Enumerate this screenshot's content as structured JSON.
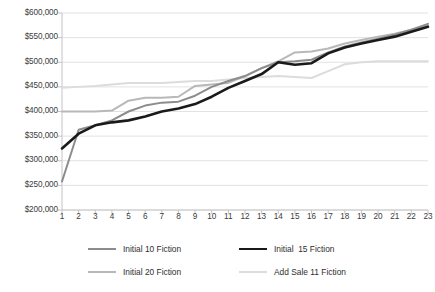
{
  "chart_data": {
    "type": "line",
    "title": "",
    "xlabel": "",
    "ylabel": "",
    "x": [
      1,
      2,
      3,
      4,
      5,
      6,
      7,
      8,
      9,
      10,
      11,
      12,
      13,
      14,
      15,
      16,
      17,
      18,
      19,
      20,
      21,
      22,
      23
    ],
    "xtick_labels": [
      "1",
      "2",
      "3",
      "4",
      "5",
      "6",
      "7",
      "8",
      "9",
      "10",
      "11",
      "12",
      "13",
      "14",
      "15",
      "16",
      "17",
      "18",
      "19",
      "20",
      "21",
      "22",
      "23"
    ],
    "ytick_labels": [
      "$600,000",
      "$550,000",
      "$500,000",
      "$450,000",
      "$400,000",
      "$350,000",
      "$300,000",
      "$250,000",
      "$200,000"
    ],
    "ytick_values": [
      600000,
      550000,
      500000,
      450000,
      400000,
      350000,
      300000,
      250000,
      200000
    ],
    "ylim": [
      200000,
      600000
    ],
    "xlim": [
      1,
      23
    ],
    "grid": "horizontal",
    "legend_position": "bottom",
    "series": [
      {
        "name": "Initial 10 Fiction",
        "color": "#8c8c8c",
        "width": 2.0,
        "values": [
          258000,
          363000,
          372000,
          382000,
          400000,
          412000,
          418000,
          420000,
          432000,
          450000,
          462000,
          472000,
          488000,
          500000,
          502000,
          505000,
          520000,
          532000,
          540000,
          548000,
          556000,
          566000,
          578000
        ]
      },
      {
        "name": "Initial  15 Fiction",
        "color": "#1a1a1a",
        "width": 2.6,
        "values": [
          325000,
          355000,
          372000,
          378000,
          382000,
          390000,
          400000,
          406000,
          415000,
          430000,
          448000,
          462000,
          476000,
          500000,
          495000,
          498000,
          518000,
          530000,
          538000,
          545000,
          552000,
          562000,
          572000
        ]
      },
      {
        "name": "Initial 20 Fiction",
        "color": "#b8b8b8",
        "width": 2.0,
        "values": [
          400000,
          400000,
          400000,
          402000,
          422000,
          428000,
          428000,
          430000,
          452000,
          455000,
          458000,
          472000,
          488000,
          502000,
          520000,
          522000,
          528000,
          538000,
          545000,
          552000,
          558000,
          566000,
          574000
        ]
      },
      {
        "name": "Add Sale 11 Fiction",
        "color": "#dcdcdc",
        "width": 2.0,
        "values": [
          448000,
          450000,
          452000,
          455000,
          458000,
          458000,
          458000,
          460000,
          462000,
          462000,
          465000,
          468000,
          470000,
          472000,
          470000,
          468000,
          482000,
          496000,
          500000,
          502000,
          502000,
          502000,
          502000
        ]
      }
    ]
  },
  "legend": {
    "items": [
      {
        "label": "Initial 10 Fiction"
      },
      {
        "label": "Initial  15 Fiction"
      },
      {
        "label": "Initial 20 Fiction"
      },
      {
        "label": "Add Sale 11 Fiction"
      }
    ]
  }
}
